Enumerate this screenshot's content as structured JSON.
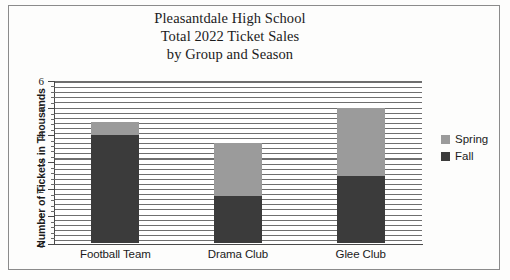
{
  "chart_data": {
    "type": "bar",
    "subtype": "stacked-vertical",
    "title": "Pleasantdale High School Total 2022 Ticket Sales by Group and Season",
    "title_lines": [
      "Pleasantdale High School",
      "Total 2022 Ticket Sales",
      "by Group and Season"
    ],
    "xlabel": "",
    "ylabel": "Number of Tickets in Thousands",
    "categories": [
      "Football Team",
      "Drama Club",
      "Glee Club"
    ],
    "series": [
      {
        "name": "Fall",
        "color": "#3b3b3b",
        "values": [
          4.0,
          1.75,
          2.5
        ]
      },
      {
        "name": "Spring",
        "color": "#9b9b9b",
        "values": [
          0.5,
          1.95,
          2.5
        ]
      }
    ],
    "totals": [
      4.5,
      3.7,
      5.0
    ],
    "ylim": [
      0,
      6
    ],
    "yticks": [
      0,
      1,
      2,
      3,
      4,
      5,
      6
    ],
    "ytick_labels": [
      "0",
      "1",
      "2",
      "3",
      "4",
      "5",
      "6"
    ],
    "grid": false,
    "plot_fill_pattern": "horizontal-hatch-lines",
    "legend_position": "right",
    "legend_entries": [
      "Spring",
      "Fall"
    ]
  },
  "legend": {
    "items": [
      {
        "label": "Spring",
        "color": "#9b9b9b"
      },
      {
        "label": "Fall",
        "color": "#3b3b3b"
      }
    ]
  }
}
